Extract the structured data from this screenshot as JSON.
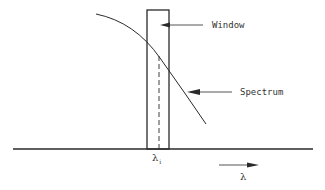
{
  "diagram": {
    "labels": {
      "window": "Window",
      "spectrum": "Spectrum",
      "lambda_i_symbol": "λ",
      "lambda_i_subscript": "i",
      "axis_symbol": "λ"
    },
    "colors": {
      "line": "#2a2a2a",
      "text": "#333333",
      "background": "#ffffff"
    },
    "elements": {
      "baseline": {
        "x1": 13,
        "x2": 313,
        "y": 149
      },
      "window_rect": {
        "x": 147,
        "y": 10,
        "width": 22,
        "height": 139
      },
      "center_dashed_line": {
        "x": 159,
        "y1": 56,
        "y2": 149
      },
      "spectrum_curve": "M 96 14 Q 135 22 160 58 L 206 124",
      "window_arrow": {
        "from": [
          203,
          25
        ],
        "to": [
          160,
          25
        ]
      },
      "spectrum_arrow": {
        "from": [
          232,
          92
        ],
        "to": [
          187,
          92
        ]
      },
      "axis_arrow": {
        "from": [
          219,
          165
        ],
        "to": [
          259,
          165
        ]
      }
    }
  }
}
